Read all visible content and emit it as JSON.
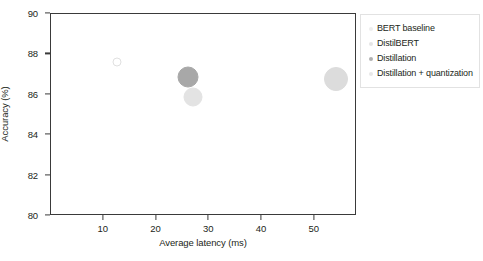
{
  "chart_data": {
    "type": "scatter",
    "title": "",
    "xlabel": "Average latency (ms)",
    "ylabel": "Accuracy (%)",
    "xlim": [
      0,
      58
    ],
    "ylim": [
      80,
      90
    ],
    "xticks": [
      10,
      20,
      30,
      40,
      50
    ],
    "yticks": [
      80,
      82,
      84,
      86,
      88,
      90
    ],
    "xtick_labels": [
      "10",
      "20",
      "30",
      "40",
      "50"
    ],
    "ytick_labels": [
      "80",
      "82",
      "84",
      "86",
      "88",
      "90"
    ],
    "grid": false,
    "legend_position": "outside-right-top",
    "series": [
      {
        "name": "BERT baseline",
        "x": 12.5,
        "y": 87.6,
        "marker_size_px": 9,
        "color": "#f4f4f4",
        "edge_color": "#e0e0e0",
        "filled": false
      },
      {
        "name": "DistilBERT",
        "x": 27.0,
        "y": 85.9,
        "marker_size_px": 19,
        "color": "#e3e3e3",
        "edge_color": "#e3e3e3",
        "filled": true
      },
      {
        "name": "Distillation",
        "x": 26.0,
        "y": 86.9,
        "marker_size_px": 21,
        "color": "#a8a8a8",
        "edge_color": "#a8a8a8",
        "filled": true
      },
      {
        "name": "Distillation + quantization",
        "x": 54.0,
        "y": 86.8,
        "marker_size_px": 24,
        "color": "#dcdcdc",
        "edge_color": "#dcdcdc",
        "filled": true
      }
    ]
  },
  "legend": {
    "entries": [
      {
        "label": "BERT baseline",
        "color": "#eeeeee",
        "size_px": 4
      },
      {
        "label": "DistilBERT",
        "color": "#e5e5e5",
        "size_px": 4
      },
      {
        "label": "Distillation",
        "color": "#b0b0b0",
        "size_px": 4
      },
      {
        "label": "Distillation + quantization",
        "color": "#e8e8e8",
        "size_px": 4
      }
    ]
  },
  "colors": {
    "axis": "#3a3a3a",
    "text": "#231f20",
    "background": "#ffffff",
    "legend_border": "#e2e2e2"
  }
}
